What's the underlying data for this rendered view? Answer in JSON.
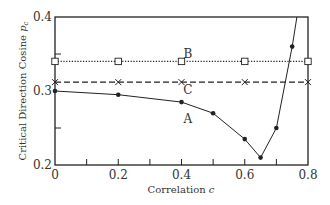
{
  "chart_data": {
    "type": "line",
    "title": "",
    "xlabel": "Correlation c",
    "ylabel": "Critical Direction Cosine p_c",
    "xlim": [
      0,
      0.8
    ],
    "ylim": [
      0.2,
      0.4
    ],
    "x_ticks": [
      "0",
      "0.2",
      "0.4",
      "0.6",
      "0.8"
    ],
    "y_ticks": [
      "0.2",
      "0.3",
      "0.4"
    ],
    "grid": false,
    "legend": "none (curves labeled inline A, B, C)",
    "series": [
      {
        "name": "A",
        "style": "solid line, filled circle markers",
        "x": [
          0,
          0.2,
          0.4,
          0.5,
          0.6,
          0.65,
          0.7,
          0.75
        ],
        "y": [
          0.3,
          0.295,
          0.285,
          0.27,
          0.235,
          0.21,
          0.25,
          0.36
        ],
        "extends_to": [
          0.765,
          0.4
        ]
      },
      {
        "name": "B",
        "style": "dotted line, open square markers",
        "x": [
          0,
          0.2,
          0.4,
          0.6,
          0.8
        ],
        "y": [
          0.34,
          0.34,
          0.34,
          0.34,
          0.34
        ]
      },
      {
        "name": "C",
        "style": "dashed line, cross markers",
        "x": [
          0,
          0.2,
          0.4,
          0.6,
          0.8
        ],
        "y": [
          0.312,
          0.312,
          0.312,
          0.312,
          0.312
        ]
      }
    ],
    "annotations": [
      {
        "text": "A",
        "x": 0.42,
        "y": 0.262
      },
      {
        "text": "B",
        "x": 0.42,
        "y": 0.35
      },
      {
        "text": "C",
        "x": 0.42,
        "y": 0.302
      }
    ]
  },
  "axes": {
    "xlabel_main": "Correlation ",
    "xlabel_var": "c",
    "ylabel_main": "Critical Direction Cosine ",
    "ylabel_var": "p",
    "ylabel_sub": "c"
  },
  "colors": {
    "ink": "#222222",
    "background": "#ffffff"
  }
}
